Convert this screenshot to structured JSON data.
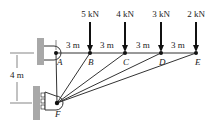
{
  "diagram": {
    "type": "truss-structure",
    "loads": [
      {
        "node": "B",
        "label": "5 kN"
      },
      {
        "node": "C",
        "label": "4 kN"
      },
      {
        "node": "D",
        "label": "3 kN"
      },
      {
        "node": "E",
        "label": "2 kN"
      }
    ],
    "spacing_labels": [
      "3 m",
      "3 m",
      "3 m",
      "3 m"
    ],
    "height_label": "4 m",
    "nodes": [
      "A",
      "B",
      "C",
      "D",
      "E",
      "F"
    ],
    "members": [
      "AB",
      "BC",
      "CD",
      "DE",
      "AF",
      "FB",
      "FC",
      "FD",
      "FE"
    ],
    "supports": {
      "A": "pin-to-wall",
      "F": "roller-on-wall"
    },
    "colors": {
      "line": "#333333",
      "wall": "#a0a0a0"
    }
  }
}
